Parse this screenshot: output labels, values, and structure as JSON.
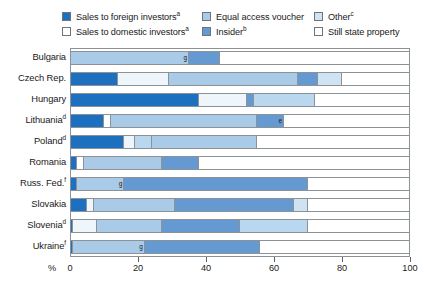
{
  "legend": {
    "items": [
      {
        "label": "Sales to foreign investors",
        "sup": "a",
        "color": "#1d6fc0",
        "name": "sales-to-foreign-investors"
      },
      {
        "label": "Sales to domestic investors",
        "sup": "a",
        "color": "#ffffff",
        "name": "sales-to-domestic-investors"
      },
      {
        "label": "Equal access voucher",
        "sup": "",
        "color": "#a9cbe8",
        "name": "equal-access-voucher"
      },
      {
        "label": "Insider",
        "sup": "b",
        "color": "#6499d2",
        "name": "insider"
      },
      {
        "label": "Other",
        "sup": "c",
        "color": "#cfe3f3",
        "name": "other"
      },
      {
        "label": "Still state property",
        "sup": "",
        "color": "#ffffff",
        "name": "still-state-property"
      }
    ]
  },
  "axis": {
    "unit_label": "%",
    "ticks": [
      "0",
      "20",
      "40",
      "60",
      "80",
      "100"
    ],
    "min": 0,
    "max": 100
  },
  "chart_data": {
    "type": "bar",
    "orientation": "horizontal",
    "stacked": true,
    "title": "",
    "xlabel": "%",
    "ylabel": "",
    "xlim": [
      0,
      100
    ],
    "grid": false,
    "legend_position": "top",
    "series": [
      {
        "name": "Sales to foreign investors",
        "color": "#1d6fc0",
        "values": [
          0,
          14,
          38,
          10,
          16,
          2,
          2,
          5,
          1,
          1
        ]
      },
      {
        "name": "Sales to domestic investors",
        "color": "#ffffff",
        "values": [
          0,
          15,
          14,
          2,
          3,
          2,
          0,
          2,
          7,
          0
        ]
      },
      {
        "name": "Equal access voucher",
        "color": "#a9cbe8",
        "values": [
          35,
          38,
          0,
          43,
          31,
          23,
          14,
          24,
          19,
          21
        ]
      },
      {
        "name": "Insider",
        "color": "#6499d2",
        "values": [
          9,
          6,
          2,
          8,
          0,
          11,
          54,
          35,
          23,
          34
        ]
      },
      {
        "name": "Other",
        "color": "#cfe3f3",
        "values": [
          0,
          7,
          18,
          0,
          5,
          0,
          0,
          4,
          20,
          0
        ]
      },
      {
        "name": "Still state property",
        "color": "#ffffff",
        "values": [
          56,
          20,
          28,
          37,
          45,
          62,
          30,
          30,
          30,
          44
        ]
      }
    ],
    "categories": [
      "Bulgaria",
      "Czech Rep.",
      "Hungary",
      "Lithuania",
      "Poland",
      "Romania",
      "Russ. Fed.",
      "Slovakia",
      "Slovenia",
      "Ukraine"
    ]
  },
  "rows": [
    {
      "label": "Bulgaria",
      "sup": "",
      "segments": [
        {
          "series": "Equal access voucher",
          "value": 35,
          "color": "#a9cbe8",
          "footnote": "g"
        },
        {
          "series": "Insider",
          "value": 9,
          "color": "#6499d2",
          "footnote": ""
        },
        {
          "series": "Still state property",
          "value": 56,
          "color": "#ffffff",
          "footnote": ""
        }
      ]
    },
    {
      "label": "Czech Rep.",
      "sup": "",
      "segments": [
        {
          "series": "Sales to foreign investors",
          "value": 14,
          "color": "#1d6fc0",
          "footnote": ""
        },
        {
          "series": "Sales to domestic investors",
          "value": 15,
          "color": "#eef5fb",
          "footnote": ""
        },
        {
          "series": "Equal access voucher",
          "value": 38,
          "color": "#a9cbe8",
          "footnote": ""
        },
        {
          "series": "Insider",
          "value": 6,
          "color": "#6499d2",
          "footnote": ""
        },
        {
          "series": "Other",
          "value": 7,
          "color": "#cfe3f3",
          "footnote": ""
        },
        {
          "series": "Still state property",
          "value": 20,
          "color": "#ffffff",
          "footnote": ""
        }
      ]
    },
    {
      "label": "Hungary",
      "sup": "",
      "segments": [
        {
          "series": "Sales to foreign investors",
          "value": 38,
          "color": "#1d6fc0",
          "footnote": ""
        },
        {
          "series": "Sales to domestic investors",
          "value": 14,
          "color": "#eef5fb",
          "footnote": ""
        },
        {
          "series": "Insider",
          "value": 2,
          "color": "#6499d2",
          "footnote": ""
        },
        {
          "series": "Other",
          "value": 18,
          "color": "#b9d7ef",
          "footnote": ""
        },
        {
          "series": "Still state property",
          "value": 28,
          "color": "#ffffff",
          "footnote": ""
        }
      ]
    },
    {
      "label": "Lithuania",
      "sup": "d",
      "segments": [
        {
          "series": "Sales to foreign investors",
          "value": 10,
          "color": "#1d6fc0",
          "footnote": ""
        },
        {
          "series": "Sales to domestic investors",
          "value": 2,
          "color": "#ffffff",
          "footnote": ""
        },
        {
          "series": "Equal access voucher",
          "value": 43,
          "color": "#a9cbe8",
          "footnote": ""
        },
        {
          "series": "Insider",
          "value": 8,
          "color": "#6499d2",
          "footnote": "e"
        },
        {
          "series": "Still state property",
          "value": 37,
          "color": "#ffffff",
          "footnote": ""
        }
      ]
    },
    {
      "label": "Poland",
      "sup": "d",
      "segments": [
        {
          "series": "Sales to foreign investors",
          "value": 16,
          "color": "#1d6fc0",
          "footnote": ""
        },
        {
          "series": "Sales to domestic investors",
          "value": 3,
          "color": "#eef5fb",
          "footnote": ""
        },
        {
          "series": "Other",
          "value": 5,
          "color": "#b9d7ef",
          "footnote": ""
        },
        {
          "series": "Equal access voucher",
          "value": 31,
          "color": "#a9cbe8",
          "footnote": ""
        },
        {
          "series": "Still state property",
          "value": 45,
          "color": "#ffffff",
          "footnote": ""
        }
      ]
    },
    {
      "label": "Romania",
      "sup": "",
      "segments": [
        {
          "series": "Sales to foreign investors",
          "value": 2,
          "color": "#1d6fc0",
          "footnote": ""
        },
        {
          "series": "Sales to domestic investors",
          "value": 2,
          "color": "#ffffff",
          "footnote": ""
        },
        {
          "series": "Equal access voucher",
          "value": 23,
          "color": "#a9cbe8",
          "footnote": ""
        },
        {
          "series": "Insider",
          "value": 11,
          "color": "#6499d2",
          "footnote": ""
        },
        {
          "series": "Still state property",
          "value": 62,
          "color": "#ffffff",
          "footnote": ""
        }
      ]
    },
    {
      "label": "Russ. Fed.",
      "sup": "f",
      "segments": [
        {
          "series": "Sales to foreign investors",
          "value": 2,
          "color": "#1d6fc0",
          "footnote": ""
        },
        {
          "series": "Equal access voucher",
          "value": 14,
          "color": "#a9cbe8",
          "footnote": "g"
        },
        {
          "series": "Insider",
          "value": 54,
          "color": "#6499d2",
          "footnote": ""
        },
        {
          "series": "Still state property",
          "value": 30,
          "color": "#ffffff",
          "footnote": ""
        }
      ]
    },
    {
      "label": "Slovakia",
      "sup": "",
      "segments": [
        {
          "series": "Sales to foreign investors",
          "value": 5,
          "color": "#1d6fc0",
          "footnote": ""
        },
        {
          "series": "Sales to domestic investors",
          "value": 2,
          "color": "#eef5fb",
          "footnote": ""
        },
        {
          "series": "Equal access voucher",
          "value": 24,
          "color": "#a9cbe8",
          "footnote": ""
        },
        {
          "series": "Insider",
          "value": 35,
          "color": "#6499d2",
          "footnote": ""
        },
        {
          "series": "Other",
          "value": 4,
          "color": "#cfe3f3",
          "footnote": ""
        },
        {
          "series": "Still state property",
          "value": 30,
          "color": "#ffffff",
          "footnote": ""
        }
      ]
    },
    {
      "label": "Slovenia",
      "sup": "d",
      "segments": [
        {
          "series": "Sales to foreign investors",
          "value": 1,
          "color": "#1d6fc0",
          "footnote": ""
        },
        {
          "series": "Sales to domestic investors",
          "value": 7,
          "color": "#eef5fb",
          "footnote": ""
        },
        {
          "series": "Equal access voucher",
          "value": 19,
          "color": "#a9cbe8",
          "footnote": ""
        },
        {
          "series": "Insider",
          "value": 23,
          "color": "#6499d2",
          "footnote": ""
        },
        {
          "series": "Other",
          "value": 20,
          "color": "#b9d7ef",
          "footnote": ""
        },
        {
          "series": "Still state property",
          "value": 30,
          "color": "#ffffff",
          "footnote": ""
        }
      ]
    },
    {
      "label": "Ukraine",
      "sup": "f",
      "segments": [
        {
          "series": "Sales to foreign investors",
          "value": 1,
          "color": "#1d6fc0",
          "footnote": ""
        },
        {
          "series": "Equal access voucher",
          "value": 21,
          "color": "#a9cbe8",
          "footnote": "g"
        },
        {
          "series": "Insider",
          "value": 34,
          "color": "#6499d2",
          "footnote": ""
        },
        {
          "series": "Still state property",
          "value": 44,
          "color": "#ffffff",
          "footnote": ""
        }
      ]
    }
  ]
}
